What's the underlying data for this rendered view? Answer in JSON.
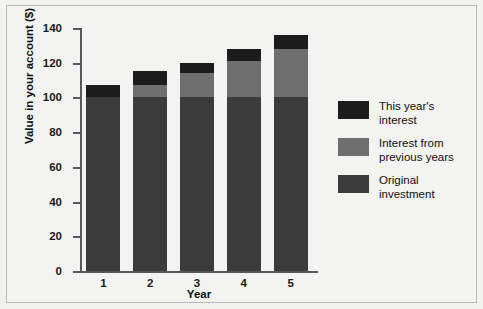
{
  "chart_data": {
    "type": "bar",
    "stacked": true,
    "title": "",
    "xlabel": "Year",
    "ylabel": "Value in your account ($)",
    "categories": [
      "1",
      "2",
      "3",
      "4",
      "5"
    ],
    "x": [
      1,
      2,
      3,
      4,
      5
    ],
    "ylim": [
      0,
      140
    ],
    "yticks": [
      0,
      20,
      40,
      60,
      80,
      100,
      120,
      140
    ],
    "ytick_labels": [
      "0",
      "20",
      "40",
      "60",
      "80",
      "100",
      "120",
      "140"
    ],
    "grid": false,
    "legend_position": "right",
    "series": [
      {
        "name": "Original investment",
        "color": "#3b3b3b",
        "values": [
          100,
          100,
          100,
          100,
          100
        ]
      },
      {
        "name": "Interest from previous years",
        "color": "#6e6e6e",
        "values": [
          0,
          7,
          14,
          21,
          28
        ]
      },
      {
        "name": "This year's interest",
        "color": "#1c1c1c",
        "values": [
          7,
          8,
          6,
          7,
          8
        ]
      }
    ],
    "totals": [
      107,
      115,
      120,
      128,
      136
    ],
    "legend_entries": [
      {
        "label_line1": "This year's",
        "label_line2": "interest",
        "color": "#1c1c1c"
      },
      {
        "label_line1": "Interest from",
        "label_line2": "previous years",
        "color": "#6e6e6e"
      },
      {
        "label_line1": "Original",
        "label_line2": "investment",
        "color": "#3b3b3b"
      }
    ],
    "axis_color": "#58585a",
    "background_color": "#f3f3f1"
  }
}
